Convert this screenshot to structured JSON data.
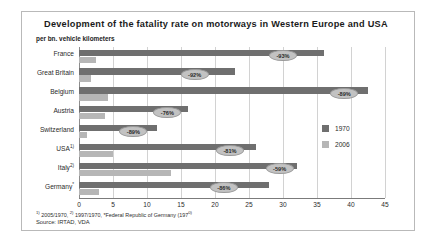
{
  "chart_data": {
    "type": "bar",
    "title": "Development of the fatality rate on motorways in Western Europe and USA",
    "subtitle": "per bn. vehicle kilometers",
    "xlabel": "",
    "ylabel": "",
    "xlim": [
      0,
      45
    ],
    "xticks": [
      0,
      5,
      10,
      15,
      20,
      25,
      30,
      35,
      40,
      45
    ],
    "grid": true,
    "orientation": "horizontal",
    "legend_position": "right",
    "categories": [
      "France",
      "Great Britain",
      "Belgium",
      "Austria",
      "Switzerland",
      "USA 1)",
      "Italy 2)",
      "Germany *"
    ],
    "series": [
      {
        "name": "1970",
        "color": "#6f6f6f",
        "values": [
          36.0,
          23.0,
          42.5,
          16.0,
          11.5,
          26.0,
          32.0,
          28.0
        ]
      },
      {
        "name": "2006",
        "color": "#b6b6b6",
        "values": [
          2.5,
          1.8,
          4.3,
          3.8,
          1.2,
          5.0,
          13.5,
          3.0
        ]
      }
    ],
    "annotations": [
      {
        "category": "France",
        "label": "-93%",
        "x": 30.0
      },
      {
        "category": "Great Britain",
        "label": "-92%",
        "x": 17.0
      },
      {
        "category": "Belgium",
        "label": "-89%",
        "x": 39.0
      },
      {
        "category": "Austria",
        "label": "-76%",
        "x": 13.0
      },
      {
        "category": "Switzerland",
        "label": "-89%",
        "x": 8.0
      },
      {
        "category": "USA 1)",
        "label": "-81%",
        "x": 22.2
      },
      {
        "category": "Italy 2)",
        "label": "-59%",
        "x": 29.5
      },
      {
        "category": "Germany *",
        "label": "-86%",
        "x": 21.3
      }
    ]
  },
  "footnote": "1) 2005/1970, 2) 1997/1970, *Federal Republic of Germany (1970)",
  "source": "Source: IRTAD, VDA"
}
